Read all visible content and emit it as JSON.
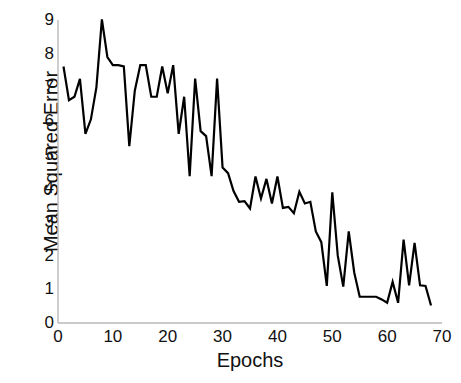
{
  "chart_data": {
    "type": "line",
    "title": "",
    "xlabel": "Epochs",
    "ylabel": "Mean Squared Error",
    "xlim": [
      0,
      70
    ],
    "ylim": [
      0,
      9
    ],
    "xticks": [
      0,
      10,
      20,
      30,
      40,
      50,
      60,
      70
    ],
    "yticks": [
      0,
      1,
      2,
      3,
      4,
      5,
      6,
      7,
      8,
      9
    ],
    "grid": false,
    "legend": null,
    "line_color": "#000000",
    "line_width": 2.2,
    "background": "#ffffff",
    "series": [
      {
        "name": "Mean Squared Error",
        "x": [
          1,
          2,
          3,
          4,
          5,
          6,
          7,
          8,
          9,
          10,
          11,
          12,
          13,
          14,
          15,
          16,
          17,
          18,
          19,
          20,
          21,
          22,
          23,
          24,
          25,
          26,
          27,
          28,
          29,
          30,
          31,
          32,
          33,
          34,
          35,
          36,
          37,
          38,
          39,
          40,
          41,
          42,
          43,
          44,
          45,
          46,
          47,
          48,
          49,
          50,
          51,
          52,
          53,
          54,
          55,
          56,
          57,
          58,
          59,
          60,
          61,
          62,
          63,
          64,
          65,
          66,
          67,
          68
        ],
        "values": [
          7.62,
          6.62,
          6.72,
          7.25,
          5.62,
          6.05,
          7.0,
          9.02,
          7.9,
          7.66,
          7.66,
          7.62,
          5.25,
          6.9,
          7.66,
          7.66,
          6.72,
          6.72,
          7.62,
          6.82,
          7.66,
          5.62,
          6.72,
          4.36,
          7.26,
          5.7,
          5.55,
          4.36,
          7.26,
          4.62,
          4.45,
          3.92,
          3.6,
          3.62,
          3.4,
          4.35,
          3.7,
          4.28,
          3.55,
          4.35,
          3.42,
          3.45,
          3.26,
          3.9,
          3.55,
          3.6,
          2.72,
          2.4,
          1.1,
          3.88,
          2.0,
          1.08,
          2.72,
          1.5,
          0.78,
          0.78,
          0.78,
          0.78,
          0.7,
          0.6,
          1.22,
          0.6,
          2.48,
          1.12,
          2.38,
          1.12,
          1.1,
          0.52
        ]
      }
    ]
  },
  "axis": {
    "x_tick_labels": [
      "0",
      "10",
      "20",
      "30",
      "40",
      "50",
      "60",
      "70"
    ],
    "y_tick_labels": [
      "0",
      "1",
      "2",
      "3",
      "4",
      "5",
      "6",
      "7",
      "8",
      "9"
    ]
  }
}
